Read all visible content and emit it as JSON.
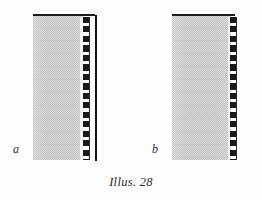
{
  "plate": {
    "caption": "Illus. 28",
    "background_color": "#fefefe",
    "width": 262,
    "height": 200
  },
  "palette": {
    "stipple_light": "#dedede",
    "stipple_dark": "#bdbdbd",
    "ink": "#1c1c1c",
    "rule": "#141414",
    "label_color": "#2b2b2b"
  },
  "figures": [
    {
      "label": "a",
      "label_position": {
        "x": 13,
        "y": 143
      },
      "body": {
        "x": 33,
        "y": 14,
        "width": 50,
        "height": 146
      },
      "cap_rule": {
        "x": 33,
        "y": 14,
        "width": 62,
        "height": 2
      },
      "dash_gutter": {
        "x": 80,
        "y": 17,
        "width": 3,
        "height": 143
      },
      "dash_column": {
        "x": 83,
        "y": 17,
        "width": 6,
        "height": 143
      },
      "dash_hairline": {
        "x": 89,
        "y": 17,
        "width": 1,
        "height": 143
      },
      "edge_rule": {
        "x": 95,
        "y": 15,
        "width": 2,
        "height": 146
      },
      "has_edge_rule": true
    },
    {
      "label": "b",
      "label_position": {
        "x": 152,
        "y": 143
      },
      "body": {
        "x": 172,
        "y": 14,
        "width": 59,
        "height": 146
      },
      "cap_rule": {
        "x": 172,
        "y": 14,
        "width": 63,
        "height": 2
      },
      "dash_gutter": {
        "x": 228,
        "y": 17,
        "width": 2,
        "height": 143
      },
      "dash_column": {
        "x": 230,
        "y": 17,
        "width": 6,
        "height": 143
      },
      "dash_hairline": {
        "x": 236,
        "y": 17,
        "width": 1,
        "height": 143
      },
      "edge_rule": null,
      "has_edge_rule": false
    }
  ],
  "caption_position": {
    "y": 175
  }
}
